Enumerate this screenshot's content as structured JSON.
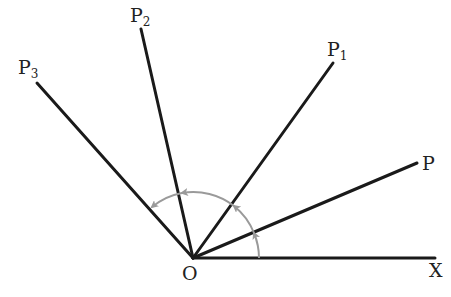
{
  "diagram": {
    "type": "angles-from-origin",
    "origin": {
      "label": "O",
      "x": 193,
      "y": 258
    },
    "rays": [
      {
        "id": "X",
        "label": "X",
        "sub": "",
        "end": [
          435,
          258
        ]
      },
      {
        "id": "P",
        "label": "P",
        "sub": "",
        "end": [
          417,
          163
        ]
      },
      {
        "id": "P1",
        "label": "P",
        "sub": "1",
        "end": [
          333,
          63
        ]
      },
      {
        "id": "P2",
        "label": "P",
        "sub": "2",
        "end": [
          141,
          29
        ]
      },
      {
        "id": "P3",
        "label": "P",
        "sub": "3",
        "end": [
          37,
          83
        ]
      }
    ],
    "arc": {
      "radius": 66,
      "color": "#999999",
      "description": "counter-clockwise rotation arrows from OX through P, P1, P2 to P3"
    },
    "colors": {
      "line": "#1a1a1a",
      "arc": "#9a9a9a",
      "text": "#222222"
    }
  }
}
